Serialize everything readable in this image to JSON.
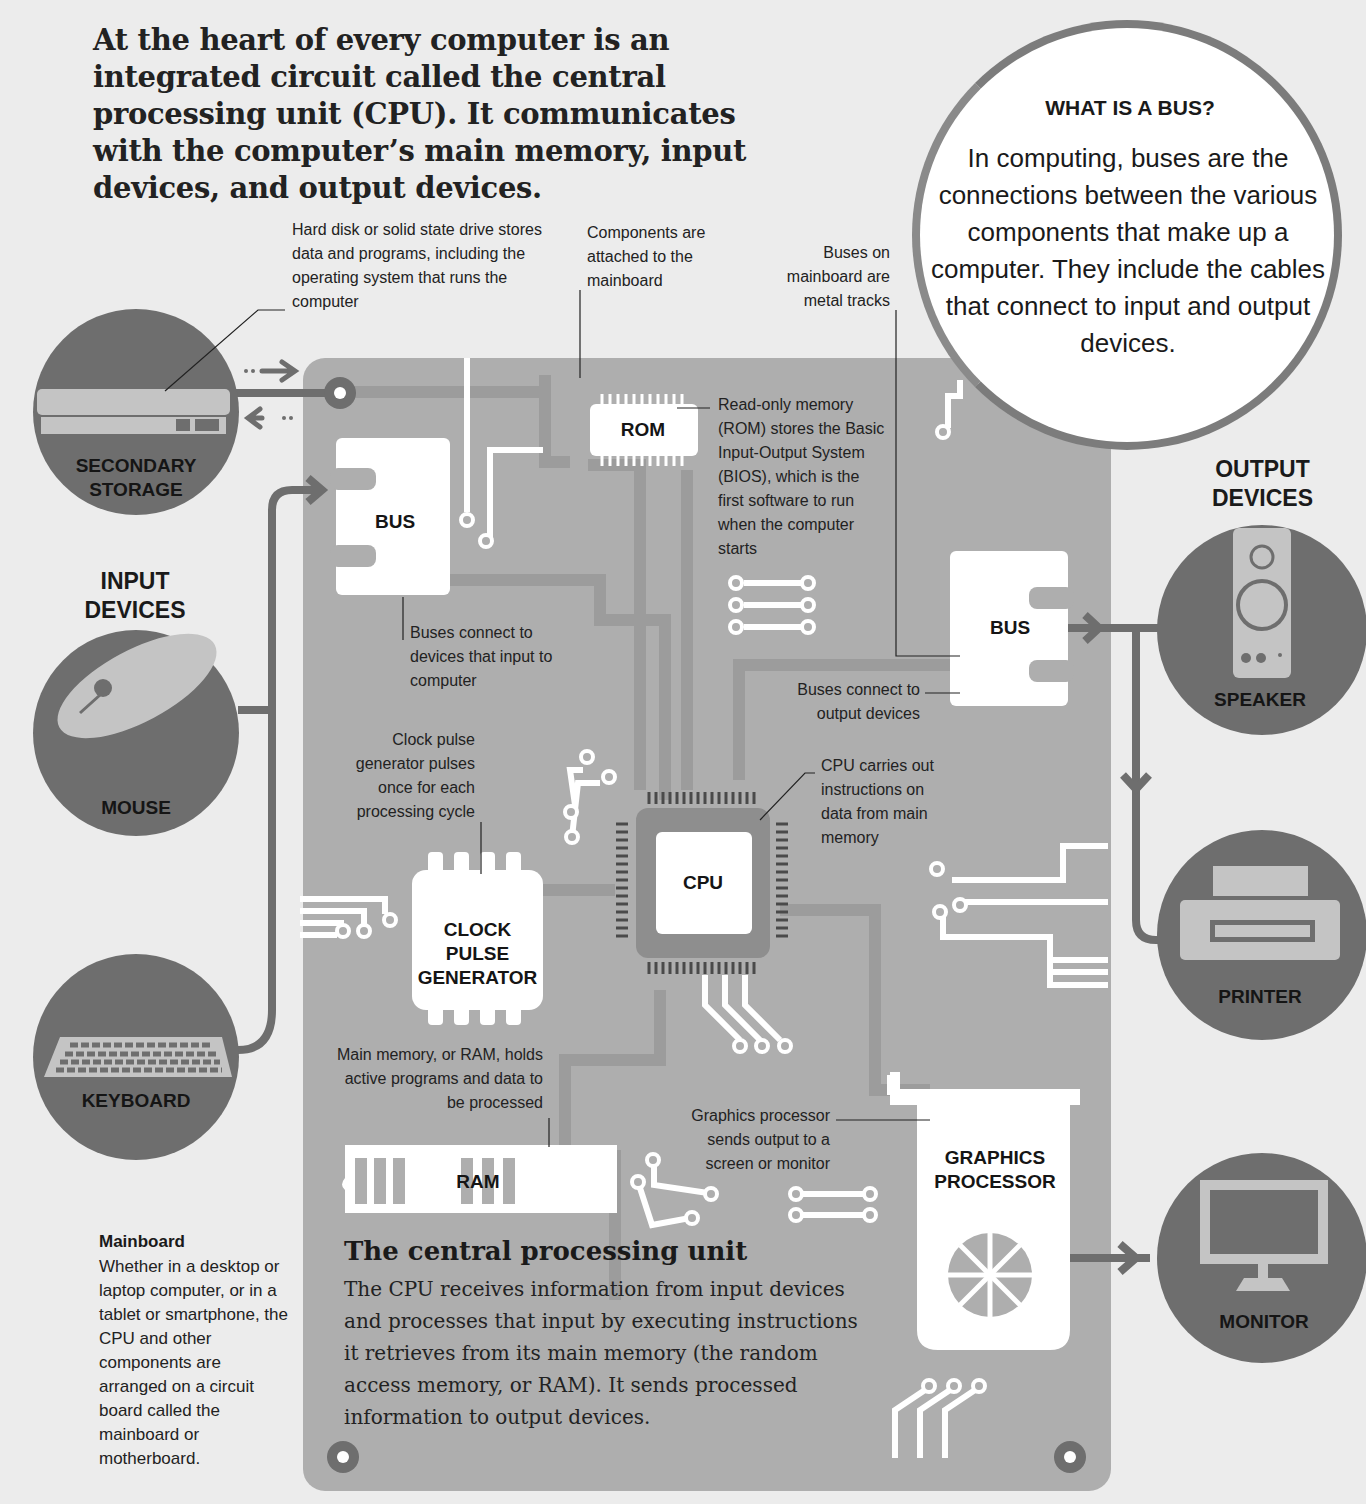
{
  "intro": {
    "text": "At the heart of every computer is an integrated circuit called the central processing unit (CPU). It communicates with the computer’s main memory, input devices, and output devices."
  },
  "sidebar_bubble": {
    "title": "WHAT IS A BUS?",
    "body": "In computing, buses are the connections between the various components that make up a computer. They include the cables that connect to input and output devices."
  },
  "groups": {
    "input": "INPUT DEVICES",
    "output": "OUTPUT DEVICES"
  },
  "devices": {
    "secondary_storage": "SECONDARY STORAGE",
    "mouse": "MOUSE",
    "keyboard": "KEYBOARD",
    "speaker": "SPEAKER",
    "printer": "PRINTER",
    "monitor": "MONITOR"
  },
  "components": {
    "bus_input": "BUS",
    "rom": "ROM",
    "bus_output": "BUS",
    "cpu": "CPU",
    "clock": "CLOCK PULSE GENERATOR",
    "ram": "RAM",
    "gpu": "GRAPHICS PROCESSOR"
  },
  "annotations": {
    "storage": "Hard disk or solid state drive stores data and programs, including the operating system that runs the computer",
    "mainboard_attach": "Components are attached to the mainboard",
    "metal_tracks": "Buses on mainboard are metal tracks",
    "rom": "Read-only memory (ROM) stores the Basic Input-Output System (BIOS), which is the first software to run when the computer starts",
    "bus_input": "Buses connect to devices that input to computer",
    "bus_output": "Buses connect to output devices",
    "clock": "Clock pulse generator pulses once for each processing cycle",
    "cpu": "CPU carries out instructions on data from main memory",
    "ram": "Main memory, or RAM, holds active programs and data to be processed",
    "gpu": "Graphics processor sends output to a screen or monitor"
  },
  "cpu_section": {
    "title": "The central processing unit",
    "body": "The CPU receives information from input devices and processes that input by executing instructions it retrieves from its main memory (the random access memory, or RAM). It sends processed information to output devices."
  },
  "mainboard_note": {
    "title": "Mainboard",
    "body": "Whether in a desktop or laptop computer, or in a tablet or smartphone, the CPU and other components are arranged on a circuit board called the mainboard or motherboard."
  },
  "colors": {
    "background": "#ececec",
    "board": "#aeaeae",
    "track": "#9d9d9d",
    "device_circle": "#6e6e6e",
    "device_icon": "#c4c4c4",
    "chip": "#ffffff",
    "text": "#1e1e1e"
  }
}
